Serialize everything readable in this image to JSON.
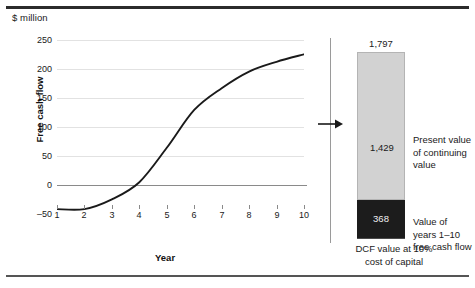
{
  "figure": {
    "unit_label": "$ million"
  },
  "chart_data": [
    {
      "type": "line",
      "title": "",
      "unit": "$ million",
      "xlabel": "Year",
      "ylabel": "Free cash flow",
      "x": [
        1,
        2,
        3,
        4,
        5,
        6,
        7,
        8,
        9,
        10
      ],
      "values": [
        -45,
        -45,
        -28,
        2,
        62,
        128,
        166,
        195,
        212,
        225
      ],
      "xlim": [
        1,
        10
      ],
      "ylim": [
        -50,
        250
      ],
      "yticks": [
        250,
        200,
        150,
        100,
        50,
        0,
        -50
      ],
      "xticks": [
        1,
        2,
        3,
        4,
        5,
        6,
        7,
        8,
        9,
        10
      ],
      "grid": true,
      "legend": "none",
      "line_color": "#1a1a1a"
    },
    {
      "type": "bar",
      "stacked": true,
      "title": "",
      "xlabel": "",
      "ylabel": "",
      "total_label": "1,797",
      "total": 1797,
      "categories": [
        "DCF value at 10% cost of capital"
      ],
      "series": [
        {
          "name": "Present value of continuing value",
          "values": [
            1429
          ],
          "data_label": "1,429",
          "color": "#d2d2d2"
        },
        {
          "name": "Value of years 1–10 free cash flow",
          "values": [
            368
          ],
          "data_label": "368",
          "color": "#1c1c1c"
        }
      ],
      "caption_lines": [
        "DCF value at 10%",
        "cost of capital"
      ]
    }
  ],
  "line_chart": {
    "yaxis_title": "Free cash flow",
    "xaxis_title": "Year",
    "ytick_labels": [
      "250",
      "200",
      "150",
      "100",
      "50",
      "0",
      "–50"
    ],
    "xtick_labels": [
      "1",
      "2",
      "3",
      "4",
      "5",
      "6",
      "7",
      "8",
      "9",
      "10"
    ]
  },
  "bar_chart": {
    "total_label": "1,797",
    "continuing_value_label": "1,429",
    "years_value_label": "368",
    "legend_continuing": [
      "Present value",
      "of continuing",
      "value"
    ],
    "legend_years": [
      "Value of",
      "years 1–10",
      "free cash flow"
    ],
    "caption": [
      "DCF value at 10%",
      "cost of capital"
    ]
  },
  "colors": {
    "continuing_value": "#d2d2d2",
    "years_value": "#1c1c1c",
    "line": "#1a1a1a",
    "grid": "#e2e2e2",
    "axis": "#8a8a8a",
    "rule": "#2b2b2b"
  }
}
